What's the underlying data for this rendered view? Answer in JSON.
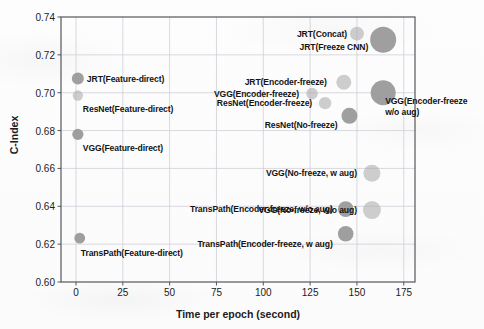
{
  "chart_data": {
    "type": "scatter",
    "title": "",
    "xlabel": "Time per epoch (second)",
    "ylabel": "C-Index",
    "xlim": [
      -8,
      181
    ],
    "ylim": [
      0.6,
      0.74
    ],
    "xticks": [
      0,
      25,
      50,
      75,
      100,
      125,
      150,
      175
    ],
    "xtick_labels": [
      "0",
      "25",
      "50",
      "75",
      "100",
      "125",
      "150",
      "175"
    ],
    "yticks": [
      0.6,
      0.62,
      0.64,
      0.66,
      0.68,
      0.7,
      0.72,
      0.74
    ],
    "ytick_labels": [
      "0.60",
      "0.62",
      "0.64",
      "0.66",
      "0.68",
      "0.70",
      "0.72",
      "0.74"
    ],
    "grid": true,
    "legend": "none",
    "bubble_color": "#b0b0b0",
    "bubble_color_dark": "#9a9a9a",
    "points": [
      {
        "label": "JRT(Feature-direct)",
        "x": 1,
        "y": 0.7075,
        "size": 6.0,
        "shade": "dark",
        "label_side": "left",
        "label_dx": 9,
        "label_dy": 0
      },
      {
        "label": "ResNet(Feature-direct)",
        "x": 1,
        "y": 0.6985,
        "size": 5.2,
        "shade": "light",
        "label_side": "left",
        "label_dx": 5,
        "label_dy": 13
      },
      {
        "label": "VGG(Feature-direct)",
        "x": 1,
        "y": 0.678,
        "size": 5.6,
        "shade": "dark",
        "label_side": "left",
        "label_dx": 5,
        "label_dy": 14
      },
      {
        "label": "TransPath(Feature-direct)",
        "x": 2,
        "y": 0.6232,
        "size": 5.4,
        "shade": "dark",
        "label_side": "left",
        "label_dx": 1,
        "label_dy": 15
      },
      {
        "label": "JRT(Concat)",
        "x": 150,
        "y": 0.7312,
        "size": 7.0,
        "shade": "light",
        "label_side": "right",
        "label_dx": -10,
        "label_dy": 0
      },
      {
        "label": "JRT(Freeze CNN)",
        "x": 164,
        "y": 0.728,
        "size": 13.0,
        "shade": "dark",
        "label_side": "right",
        "label_dx": -15,
        "label_dy": 7
      },
      {
        "label": "JRT(Encoder-freeze)",
        "x": 143,
        "y": 0.7055,
        "size": 7.5,
        "shade": "light",
        "label_side": "right",
        "label_dx": -17,
        "label_dy": 0
      },
      {
        "label": "VGG(Encoder-freeze)",
        "x": 126,
        "y": 0.6995,
        "size": 5.8,
        "shade": "light",
        "label_side": "right",
        "label_dx": -13,
        "label_dy": 0
      },
      {
        "label": "ResNet(Encoder-freeze)",
        "x": 133,
        "y": 0.6945,
        "size": 6.2,
        "shade": "light",
        "label_side": "right",
        "label_dx": -13,
        "label_dy": 0
      },
      {
        "label": "VGG(Encoder-freeze\nw/o aug)",
        "x": 164,
        "y": 0.7,
        "size": 12.5,
        "shade": "dark",
        "label_side": "left",
        "label_dx": 2,
        "label_dy": 14
      },
      {
        "label": "ResNet(No-freeze)",
        "x": 146,
        "y": 0.6878,
        "size": 8.0,
        "shade": "dark",
        "label_side": "right",
        "label_dx": -12,
        "label_dy": 9
      },
      {
        "label": "VGG(No-freeze, w aug)",
        "x": 158,
        "y": 0.6575,
        "size": 8.5,
        "shade": "light",
        "label_side": "right",
        "label_dx": -15,
        "label_dy": 0
      },
      {
        "label": "VGG(No-freeze, w/o aug)",
        "x": 158,
        "y": 0.638,
        "size": 9.0,
        "shade": "light",
        "label_side": "right",
        "label_dx": -15,
        "label_dy": 0
      },
      {
        "label": "TransPath(Encoder-freeze, w/o aug)",
        "x": 144,
        "y": 0.6385,
        "size": 7.8,
        "shade": "dark",
        "label_side": "right",
        "label_dx": -13,
        "label_dy": 0
      },
      {
        "label": "TransPath(Encoder-freeze, w aug)",
        "x": 144,
        "y": 0.6255,
        "size": 7.8,
        "shade": "dark",
        "label_side": "right",
        "label_dx": -13,
        "label_dy": 10
      }
    ]
  }
}
